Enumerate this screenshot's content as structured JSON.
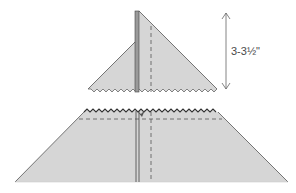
{
  "diagram": {
    "measurement_label": "3-3½\"",
    "colors": {
      "fabric_fill": "#d6d6d6",
      "outline": "#555555",
      "seam_line": "#444444",
      "dashed_line": "#555555",
      "arrow": "#666666",
      "label": "#4a4a4a"
    },
    "pieces": [
      {
        "name": "top-triangle-piece",
        "description": "upper triangle with folded seam and pinked bottom edge"
      },
      {
        "name": "bottom-trapezoid-piece",
        "description": "lower trapezoid with pinked top edge and dashed stitching lines"
      }
    ]
  }
}
